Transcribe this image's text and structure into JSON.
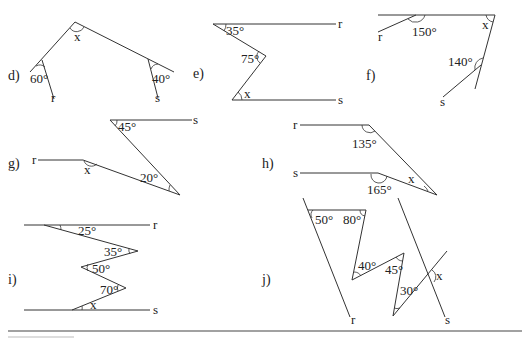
{
  "problems": {
    "d": {
      "label": "d)",
      "angles": [
        "x",
        "60°",
        "40°"
      ],
      "lines": [
        "r",
        "s"
      ]
    },
    "e": {
      "label": "e)",
      "angles": [
        "35°",
        "75°",
        "x"
      ],
      "lines": [
        "r",
        "s"
      ]
    },
    "f": {
      "label": "f)",
      "angles": [
        "150°",
        "x",
        "140°"
      ],
      "lines": [
        "r",
        "s"
      ]
    },
    "g": {
      "label": "g)",
      "angles": [
        "45°",
        "x",
        "20°"
      ],
      "lines": [
        "r",
        "s"
      ]
    },
    "h": {
      "label": "h)",
      "angles": [
        "135°",
        "165°",
        "x"
      ],
      "lines": [
        "r",
        "s"
      ]
    },
    "i": {
      "label": "i)",
      "angles": [
        "25°",
        "35°",
        "50°",
        "70°",
        "x"
      ],
      "lines": [
        "r",
        "s"
      ]
    },
    "j": {
      "label": "j)",
      "angles": [
        "50°",
        "80°",
        "40°",
        "45°",
        "30°",
        "x"
      ],
      "lines": [
        "r",
        "s"
      ]
    }
  }
}
